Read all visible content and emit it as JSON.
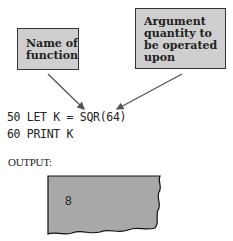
{
  "labels": {
    "name_of_function": "Name of function",
    "argument": "Argument quantity to be operated upon"
  },
  "code": {
    "line1": "50 LET K = SQR(64)",
    "line2": "60 PRINT K"
  },
  "output": {
    "label": "OUTPUT:",
    "value": "8"
  }
}
